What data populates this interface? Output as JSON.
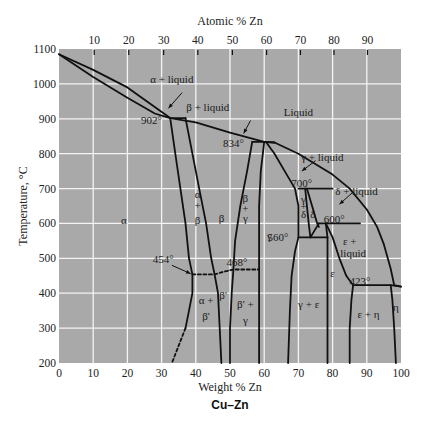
{
  "chart_data": {
    "type": "line",
    "title": "Cu–Zn",
    "subtitle": "Phase diagram",
    "xlabel": "Weight % Zn",
    "x2label": "Atomic % Zn",
    "ylabel": "Temperature, °C",
    "xlim": [
      0,
      100
    ],
    "ylim": [
      200,
      1100
    ],
    "grid": true,
    "x_ticks": [
      0,
      10,
      20,
      30,
      40,
      50,
      60,
      70,
      80,
      90,
      100
    ],
    "y_ticks": [
      200,
      300,
      400,
      500,
      600,
      700,
      800,
      900,
      1000,
      1100
    ],
    "atomic_ticks": [
      {
        "label": "10",
        "wt": 10.3
      },
      {
        "label": "20",
        "wt": 20.4
      },
      {
        "label": "30",
        "wt": 30.6
      },
      {
        "label": "40",
        "wt": 40.6
      },
      {
        "label": "50",
        "wt": 50.7
      },
      {
        "label": "60",
        "wt": 60.7
      },
      {
        "label": "70",
        "wt": 70.6
      },
      {
        "label": "80",
        "wt": 80.4
      },
      {
        "label": "90",
        "wt": 90.2
      }
    ],
    "invariant_temps": [
      {
        "label": "902°",
        "T": 902
      },
      {
        "label": "834°",
        "T": 834
      },
      {
        "label": "700°",
        "T": 700
      },
      {
        "label": "600°",
        "T": 600
      },
      {
        "label": "560°",
        "T": 560
      },
      {
        "label": "468°",
        "T": 468
      },
      {
        "label": "454°",
        "T": 454
      },
      {
        "label": "423°",
        "T": 423
      }
    ],
    "series": [
      {
        "name": "liquidus",
        "style": "solid",
        "points": [
          [
            0,
            1085
          ],
          [
            10,
            1040
          ],
          [
            20,
            990
          ],
          [
            32.5,
            902
          ],
          [
            40,
            890
          ],
          [
            50,
            860
          ],
          [
            60,
            834
          ],
          [
            63,
            832
          ],
          [
            70,
            800
          ],
          [
            80,
            740
          ],
          [
            85,
            700
          ],
          [
            90,
            640
          ],
          [
            93,
            590
          ],
          [
            95,
            540
          ],
          [
            97,
            470
          ],
          [
            98,
            423
          ],
          [
            100,
            419
          ]
        ]
      },
      {
        "name": "alpha solidus",
        "style": "solid",
        "points": [
          [
            0,
            1085
          ],
          [
            10,
            1020
          ],
          [
            20,
            960
          ],
          [
            28,
            915
          ],
          [
            32.5,
            902
          ]
        ]
      },
      {
        "name": "alpha solvus",
        "style": "solid",
        "points": [
          [
            32.5,
            902
          ],
          [
            34,
            800
          ],
          [
            35.5,
            700
          ],
          [
            37,
            600
          ],
          [
            38,
            500
          ],
          [
            39,
            454
          ],
          [
            39,
            400
          ],
          [
            38,
            350
          ],
          [
            37,
            300
          ]
        ]
      },
      {
        "name": "alpha solvus low (dashed)",
        "style": "dashed",
        "points": [
          [
            37,
            300
          ],
          [
            35,
            250
          ],
          [
            33,
            200
          ]
        ]
      },
      {
        "name": "beta left boundary",
        "style": "solid",
        "points": [
          [
            37,
            902
          ],
          [
            39,
            800
          ],
          [
            41,
            700
          ],
          [
            43,
            600
          ],
          [
            44.5,
            500
          ],
          [
            45.5,
            454
          ],
          [
            46.5,
            400
          ],
          [
            47,
            300
          ],
          [
            47.5,
            200
          ]
        ]
      },
      {
        "name": "beta right boundary",
        "style": "solid",
        "points": [
          [
            56.5,
            834
          ],
          [
            55,
            750
          ],
          [
            53,
            650
          ],
          [
            51.5,
            550
          ],
          [
            51,
            468
          ],
          [
            50.5,
            400
          ],
          [
            50,
            300
          ],
          [
            50,
            200
          ]
        ]
      },
      {
        "name": "gamma left boundary",
        "style": "solid",
        "points": [
          [
            60,
            834
          ],
          [
            59,
            750
          ],
          [
            58.5,
            650
          ],
          [
            58.5,
            550
          ],
          [
            58.5,
            468
          ],
          [
            58.5,
            400
          ],
          [
            58.5,
            300
          ],
          [
            58.5,
            200
          ]
        ]
      },
      {
        "name": "gamma right boundary",
        "style": "solid",
        "points": [
          [
            60.5,
            834
          ],
          [
            63,
            800
          ],
          [
            66,
            750
          ],
          [
            69,
            700
          ],
          [
            70,
            650
          ],
          [
            70,
            600
          ],
          [
            70,
            560
          ],
          [
            69,
            520
          ],
          [
            68,
            450
          ],
          [
            67.5,
            350
          ],
          [
            67,
            200
          ]
        ]
      },
      {
        "name": "gamma solidus",
        "style": "solid",
        "points": [
          [
            60,
            834
          ],
          [
            63,
            832
          ]
        ]
      },
      {
        "name": "beta/beta' ordering (dashed)",
        "style": "dashed",
        "points": [
          [
            39,
            454
          ],
          [
            45.5,
            454
          ],
          [
            47.5,
            460
          ],
          [
            51,
            468
          ],
          [
            58.5,
            468
          ]
        ]
      },
      {
        "name": "902 peritectic",
        "style": "solid",
        "points": [
          [
            32.5,
            902
          ],
          [
            37,
            902
          ]
        ]
      },
      {
        "name": "834 peritectic",
        "style": "solid",
        "points": [
          [
            56.5,
            834
          ],
          [
            60,
            834
          ]
        ]
      },
      {
        "name": "700 peritectic",
        "style": "solid",
        "points": [
          [
            70,
            700
          ],
          [
            80,
            700
          ]
        ]
      },
      {
        "name": "delta left",
        "style": "solid",
        "points": [
          [
            72,
            700
          ],
          [
            72.5,
            650
          ],
          [
            73,
            600
          ],
          [
            73.5,
            560
          ]
        ]
      },
      {
        "name": "delta right",
        "style": "solid",
        "points": [
          [
            72.5,
            700
          ],
          [
            74,
            650
          ],
          [
            75.5,
            600
          ],
          [
            76,
            590
          ]
        ]
      },
      {
        "name": "600 peritectic",
        "style": "solid",
        "points": [
          [
            76,
            600
          ],
          [
            88,
            600
          ]
        ]
      },
      {
        "name": "560 eutectoid",
        "style": "solid",
        "points": [
          [
            70,
            560
          ],
          [
            78.5,
            560
          ]
        ]
      },
      {
        "name": "delta to eutectoid",
        "style": "solid",
        "points": [
          [
            76,
            600
          ],
          [
            73.5,
            560
          ]
        ]
      },
      {
        "name": "epsilon left",
        "style": "solid",
        "points": [
          [
            78,
            600
          ],
          [
            78.5,
            560
          ],
          [
            78.5,
            500
          ],
          [
            78.5,
            400
          ],
          [
            78.5,
            300
          ],
          [
            78.5,
            200
          ]
        ]
      },
      {
        "name": "epsilon right / solidus",
        "style": "solid",
        "points": [
          [
            78,
            600
          ],
          [
            80,
            560
          ],
          [
            82,
            500
          ],
          [
            84,
            450
          ],
          [
            86,
            423
          ],
          [
            85.5,
            380
          ],
          [
            85,
            300
          ],
          [
            85,
            200
          ]
        ]
      },
      {
        "name": "423 peritectic",
        "style": "solid",
        "points": [
          [
            86,
            423
          ],
          [
            97,
            423
          ],
          [
            100,
            419
          ]
        ]
      },
      {
        "name": "eta boundary",
        "style": "solid",
        "points": [
          [
            97,
            423
          ],
          [
            97.5,
            380
          ],
          [
            98,
            300
          ],
          [
            98.5,
            200
          ]
        ]
      }
    ],
    "arrows": [
      {
        "from": [
          36,
          975
        ],
        "to": [
          32,
          930
        ]
      },
      {
        "from": [
          56,
          895
        ],
        "to": [
          54,
          858
        ]
      },
      {
        "from": [
          75,
          780
        ],
        "to": [
          71,
          750
        ]
      },
      {
        "from": [
          86,
          690
        ],
        "to": [
          82,
          655
        ]
      },
      {
        "from": [
          33,
          480
        ],
        "to": [
          38.5,
          456
        ]
      }
    ],
    "regions": [
      {
        "label": "α + liquid",
        "wt": 33,
        "T": 1010
      },
      {
        "label": "β + liquid",
        "wt": 43.5,
        "T": 930
      },
      {
        "label": "Liquid",
        "wt": 70,
        "T": 915
      },
      {
        "label": "γ + liquid",
        "wt": 77,
        "T": 785
      },
      {
        "label": "δ + liquid",
        "wt": 87,
        "T": 690
      },
      {
        "label": "α",
        "wt": 19,
        "T": 605
      },
      {
        "label": "α",
        "wt": 40.5,
        "T": 680
      },
      {
        "label": "+",
        "wt": 40.5,
        "T": 650
      },
      {
        "label": "β",
        "wt": 40.5,
        "T": 605
      },
      {
        "label": "β",
        "wt": 47.5,
        "T": 610
      },
      {
        "label": "β",
        "wt": 54.5,
        "T": 670
      },
      {
        "label": "+",
        "wt": 54.5,
        "T": 640
      },
      {
        "label": "γ",
        "wt": 54.5,
        "T": 610
      },
      {
        "label": "γ",
        "wt": 61.5,
        "T": 560
      },
      {
        "label": "γ",
        "wt": 71.5,
        "T": 665
      },
      {
        "label": "+",
        "wt": 71.5,
        "T": 645
      },
      {
        "label": "δ",
        "wt": 71.5,
        "T": 622
      },
      {
        "label": "δ",
        "wt": 74.2,
        "T": 622
      },
      {
        "label": "ε +",
        "wt": 85,
        "T": 545
      },
      {
        "label": "liquid",
        "wt": 86,
        "T": 510
      },
      {
        "label": "ε",
        "wt": 80,
        "T": 455
      },
      {
        "label": "α +",
        "wt": 43,
        "T": 375
      },
      {
        "label": "β'",
        "wt": 43,
        "T": 330
      },
      {
        "label": "β'",
        "wt": 48,
        "T": 390
      },
      {
        "label": "β' +",
        "wt": 54.5,
        "T": 365
      },
      {
        "label": "γ",
        "wt": 54.5,
        "T": 320
      },
      {
        "label": "γ + ε",
        "wt": 73,
        "T": 365
      },
      {
        "label": "ε + η",
        "wt": 90.5,
        "T": 335
      },
      {
        "label": "η",
        "wt": 98.5,
        "T": 355
      }
    ],
    "temp_labels": [
      {
        "label": "902°",
        "wt": 27,
        "T": 892
      },
      {
        "label": "834°",
        "wt": 51,
        "T": 825
      },
      {
        "label": "700°",
        "wt": 71,
        "T": 712
      },
      {
        "label": "600°",
        "wt": 80.5,
        "T": 608
      },
      {
        "label": "560°",
        "wt": 64,
        "T": 558
      },
      {
        "label": "454°",
        "wt": 30.5,
        "T": 495
      },
      {
        "label": "468°",
        "wt": 52,
        "T": 485
      },
      {
        "label": "423°",
        "wt": 88,
        "T": 432
      }
    ]
  },
  "colors": {
    "plot_bg": "#a9a9a9",
    "grid": "#f4f4f4",
    "line": "#111111",
    "text": "#1a1a1a"
  }
}
